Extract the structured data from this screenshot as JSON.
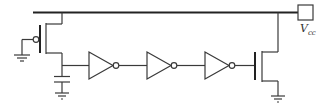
{
  "diagram": {
    "type": "circuit-schematic",
    "supply_label": {
      "main": "V",
      "subscript": "cc"
    },
    "components": [
      {
        "id": "pmos-input",
        "kind": "PMOS transistor",
        "gate": "grounded"
      },
      {
        "id": "cap-node",
        "kind": "capacitor to ground"
      },
      {
        "id": "inv-1",
        "kind": "inverter"
      },
      {
        "id": "inv-2",
        "kind": "inverter"
      },
      {
        "id": "inv-3",
        "kind": "inverter"
      },
      {
        "id": "nmos-output",
        "kind": "NMOS transistor"
      },
      {
        "id": "vcc-pin",
        "kind": "supply terminal"
      }
    ],
    "colors": {
      "wire": "#3a3a3a",
      "background": "#ffffff"
    }
  }
}
